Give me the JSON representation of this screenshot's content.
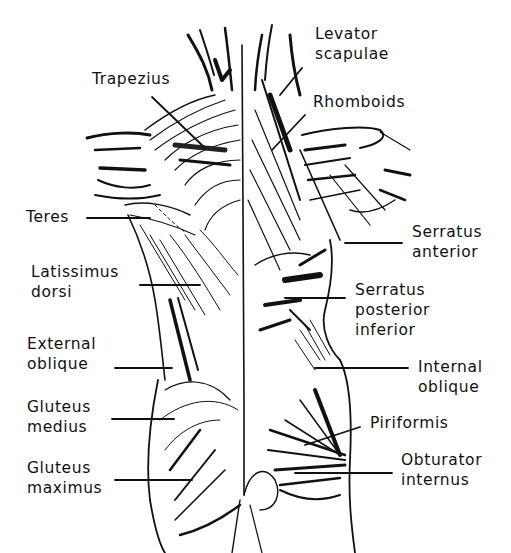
{
  "figure": {
    "ink_color": "#111111",
    "background": "#ffffff"
  },
  "labels": {
    "trapezius": {
      "lines": [
        "Trapezius"
      ]
    },
    "levator_scapulae": {
      "lines": [
        "Levator",
        "scapulae"
      ]
    },
    "rhomboids": {
      "lines": [
        "Rhomboids"
      ]
    },
    "teres": {
      "lines": [
        "Teres"
      ]
    },
    "serratus_anterior": {
      "lines": [
        "Serratus",
        "anterior"
      ]
    },
    "latissimus_dorsi": {
      "lines": [
        "Latissimus",
        "dorsi"
      ]
    },
    "serratus_posterior_inferior": {
      "lines": [
        "Serratus",
        "posterior",
        "inferior"
      ]
    },
    "external_oblique": {
      "lines": [
        "External",
        "oblique"
      ]
    },
    "internal_oblique": {
      "lines": [
        "Internal",
        "oblique"
      ]
    },
    "gluteus_medius": {
      "lines": [
        "Gluteus",
        "medius"
      ]
    },
    "piriformis": {
      "lines": [
        "Piriformis"
      ]
    },
    "gluteus_maximus": {
      "lines": [
        "Gluteus",
        "maximus"
      ]
    },
    "obturator_internus": {
      "lines": [
        "Obturator",
        "internus"
      ]
    }
  }
}
